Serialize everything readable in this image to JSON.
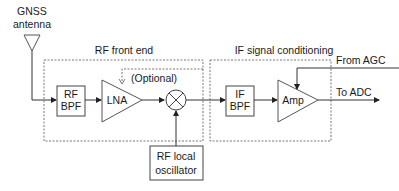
{
  "diagram": {
    "antenna": {
      "line1": "GNSS",
      "line2": "antenna"
    },
    "groups": {
      "rf_front_end": "RF front end",
      "if_conditioning": "IF signal conditioning"
    },
    "blocks": {
      "rf_bpf": {
        "line1": "RF",
        "line2": "BPF"
      },
      "lna": "LNA",
      "optional": "(Optional)",
      "mixer": "mixer",
      "lo": {
        "line1": "RF local",
        "line2": "oscillator"
      },
      "if_bpf": {
        "line1": "IF",
        "line2": "BPF"
      },
      "amp": "Amp"
    },
    "signals": {
      "from_agc": "From AGC",
      "to_adc": "To ADC"
    }
  }
}
